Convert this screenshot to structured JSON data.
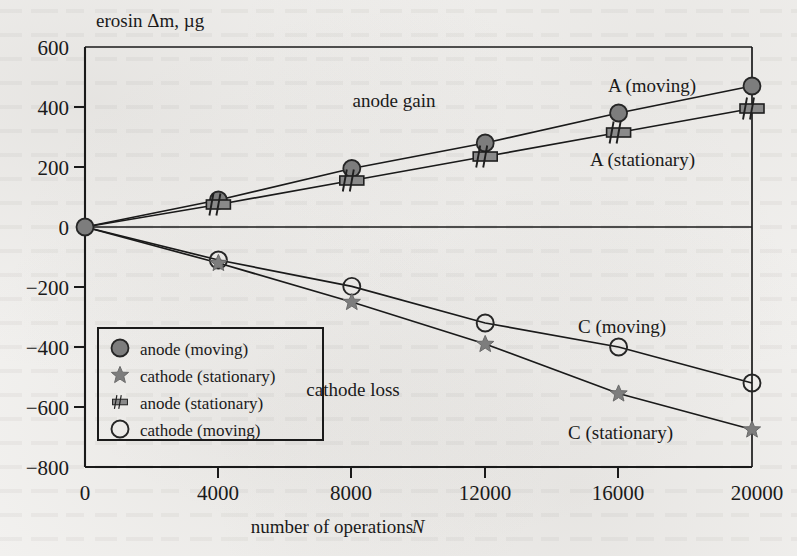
{
  "figure": {
    "y_axis_title": "erosin Δm, µg",
    "x_axis_title_main": "number of operations",
    "x_axis_title_symbol": "N",
    "annotations": {
      "anode_gain": "anode gain",
      "cathode_loss": "cathode loss",
      "a_moving": "A (moving)",
      "a_stationary": "A (stationary)",
      "c_moving": "C (moving)",
      "c_stationary": "C (stationary)"
    }
  },
  "legend": {
    "items": [
      {
        "label": "anode (moving)",
        "marker": "filled-circle-icon"
      },
      {
        "label": "cathode (stationary)",
        "marker": "filled-star-icon"
      },
      {
        "label": "anode (stationary)",
        "marker": "hatched-bar-icon"
      },
      {
        "label": "cathode (moving)",
        "marker": "open-circle-icon"
      }
    ]
  },
  "colors": {
    "paper": "#f3f2f0",
    "ink": "#1a1a1a",
    "marker_gray": "#7d7d7d",
    "marker_edge": "#2b2b2b"
  },
  "chart_data": {
    "type": "line",
    "title": "",
    "xlabel": "number of operations N",
    "ylabel": "erosin Δm, µg",
    "xlim": [
      0,
      20000
    ],
    "ylim": [
      -800,
      600
    ],
    "xticks": [
      0,
      4000,
      8000,
      12000,
      16000,
      20000
    ],
    "xtick_labels": [
      "0",
      "4000",
      "8000",
      "12000",
      "16000",
      "20000"
    ],
    "yticks": [
      -800,
      -600,
      -400,
      -200,
      0,
      200,
      400,
      600
    ],
    "ytick_labels": [
      "−800",
      "−600",
      "−400",
      "−200",
      "0",
      "200",
      "400",
      "600"
    ],
    "grid": false,
    "legend_position": "lower-left-inside",
    "x": [
      0,
      4000,
      8000,
      12000,
      16000,
      20000
    ],
    "series": [
      {
        "name": "anode (moving)",
        "label": "A (moving)",
        "marker": "filled-circle-icon",
        "values": [
          0,
          90,
          195,
          280,
          380,
          470
        ]
      },
      {
        "name": "anode (stationary)",
        "label": "A (stationary)",
        "marker": "hatched-bar-icon",
        "values": [
          0,
          75,
          155,
          235,
          315,
          395
        ]
      },
      {
        "name": "cathode (moving)",
        "label": "C (moving)",
        "marker": "open-circle-icon",
        "values": [
          0,
          -110,
          -198,
          -320,
          -400,
          -520
        ]
      },
      {
        "name": "cathode (stationary)",
        "label": "C (stationary)",
        "marker": "filled-star-icon",
        "values": [
          0,
          -120,
          -250,
          -390,
          -555,
          -675
        ]
      }
    ]
  }
}
